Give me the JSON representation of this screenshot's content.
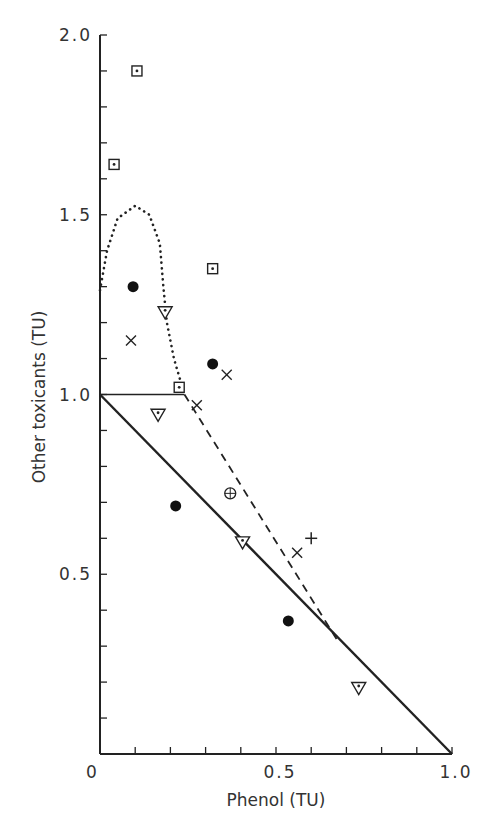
{
  "chart_data": {
    "type": "scatter",
    "title": "",
    "xlabel": "Phenol (TU)",
    "ylabel": "Other toxicants (TU)",
    "xlim": [
      0,
      1.0
    ],
    "ylim": [
      0,
      2.0
    ],
    "grid": false,
    "legend": null,
    "x_ticks": [
      0,
      0.5,
      1.0
    ],
    "x_tick_labels": [
      "0",
      "0.5",
      "1.0"
    ],
    "x_minor_step": 0.1,
    "y_ticks": [
      0.5,
      1.0,
      1.5,
      2.0
    ],
    "y_tick_labels": [
      "0.5",
      "1.0",
      "1.5",
      "2.0"
    ],
    "y_minor_step": 0.1,
    "series": [
      {
        "name": "square-with-dot",
        "marker": "square-dot",
        "points": [
          [
            0.04,
            1.64
          ],
          [
            0.105,
            1.9
          ],
          [
            0.32,
            1.35
          ],
          [
            0.225,
            1.02
          ]
        ]
      },
      {
        "name": "filled-circle",
        "marker": "filled-circle",
        "points": [
          [
            0.094,
            1.3
          ],
          [
            0.32,
            1.085
          ],
          [
            0.215,
            0.69
          ],
          [
            0.535,
            0.37
          ]
        ]
      },
      {
        "name": "triangle-with-dot",
        "marker": "triangle-dot",
        "points": [
          [
            0.185,
            1.23
          ],
          [
            0.165,
            0.945
          ],
          [
            0.405,
            0.59
          ],
          [
            0.735,
            0.185
          ]
        ]
      },
      {
        "name": "cross-x",
        "marker": "x",
        "points": [
          [
            0.088,
            1.15
          ],
          [
            0.36,
            1.055
          ],
          [
            0.275,
            0.97
          ],
          [
            0.56,
            0.56
          ]
        ]
      },
      {
        "name": "plus",
        "marker": "plus",
        "points": [
          [
            0.6,
            0.6
          ]
        ]
      },
      {
        "name": "circle-plus",
        "marker": "circle-plus",
        "points": [
          [
            0.37,
            0.725
          ]
        ]
      }
    ],
    "lines": [
      {
        "name": "additivity-line",
        "style": "solid-thick",
        "points": [
          [
            0,
            1.0
          ],
          [
            1.0,
            0
          ]
        ]
      },
      {
        "name": "horizontal-reference",
        "style": "solid-thin",
        "points": [
          [
            0,
            1.0
          ],
          [
            0.24,
            1.0
          ]
        ]
      },
      {
        "name": "dashed-boundary",
        "style": "dashed",
        "points": [
          [
            0.24,
            1.0
          ],
          [
            0.675,
            0.315
          ]
        ]
      },
      {
        "name": "dotted-boundary",
        "style": "dotted",
        "points": [
          [
            0,
            1.29
          ],
          [
            0.02,
            1.4
          ],
          [
            0.05,
            1.49
          ],
          [
            0.1,
            1.525
          ],
          [
            0.14,
            1.5
          ],
          [
            0.17,
            1.42
          ],
          [
            0.18,
            1.3
          ],
          [
            0.19,
            1.2
          ],
          [
            0.21,
            1.1
          ],
          [
            0.24,
            1.0
          ]
        ]
      }
    ]
  }
}
